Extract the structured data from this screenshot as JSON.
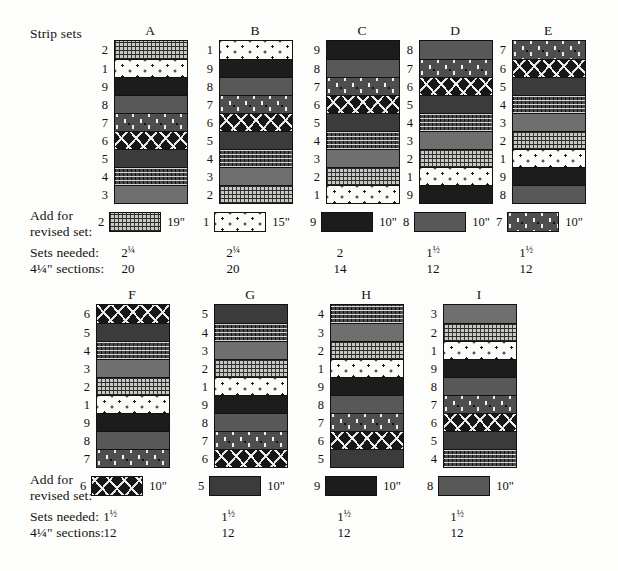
{
  "header": {
    "strip_sets_label": "Strip sets"
  },
  "row_labels": {
    "add_for": "Add for",
    "revised_set": "revised set:",
    "sets_needed": "Sets needed:",
    "sections": "4¼\" sections:"
  },
  "fabric_legend": {
    "1": "white-small-diamond-print",
    "2": "light-grey-pindot-grid",
    "3": "medium-grey-solid",
    "4": "dark-grey-pindot-grid",
    "5": "dark-charcoal-solid",
    "6": "black-white-diagonal-dash-print",
    "7": "dark-grey-light-comma-dot-print",
    "8": "dark-medium-grey-solid",
    "9": "near-black-solid"
  },
  "colors": {
    "fabric_1": "#fbfbf7",
    "fabric_2": "#c9c9c3",
    "fabric_3": "#6f6f6f",
    "fabric_4": "#4a4a4a",
    "fabric_5": "#3b3b3b",
    "fabric_6": "#171717",
    "fabric_7": "#4e4e4e",
    "fabric_8": "#585858",
    "fabric_9": "#1c1c1c",
    "outline": "#111111",
    "page_background": "#fdfdfb"
  },
  "strip_sets": [
    {
      "name": "A",
      "strips": [
        "2",
        "1",
        "9",
        "8",
        "7",
        "6",
        "5",
        "4",
        "3"
      ],
      "add_strip": "2",
      "add_length": "19\"",
      "sets_needed": "2¼",
      "sections": "20"
    },
    {
      "name": "B",
      "strips": [
        "1",
        "9",
        "8",
        "7",
        "6",
        "5",
        "4",
        "3",
        "2"
      ],
      "add_strip": "1",
      "add_length": "15\"",
      "sets_needed": "2¼",
      "sections": "20"
    },
    {
      "name": "C",
      "strips": [
        "9",
        "8",
        "7",
        "6",
        "5",
        "4",
        "3",
        "2",
        "1"
      ],
      "add_strip": "9",
      "add_length": "10\"",
      "sets_needed": "2",
      "sections": "14"
    },
    {
      "name": "D",
      "strips": [
        "8",
        "7",
        "6",
        "5",
        "4",
        "3",
        "2",
        "1",
        "9"
      ],
      "add_strip": "8",
      "add_length": "10\"",
      "sets_needed": "1½",
      "sections": "12"
    },
    {
      "name": "E",
      "strips": [
        "7",
        "6",
        "5",
        "4",
        "3",
        "2",
        "1",
        "9",
        "8"
      ],
      "add_strip": "7",
      "add_length": "10\"",
      "sets_needed": "1½",
      "sections": "12"
    },
    {
      "name": "F",
      "strips": [
        "6",
        "5",
        "4",
        "3",
        "2",
        "1",
        "9",
        "8",
        "7"
      ],
      "add_strip": "6",
      "add_length": "10\"",
      "sets_needed": "1½",
      "sections": "12"
    },
    {
      "name": "G",
      "strips": [
        "5",
        "4",
        "3",
        "2",
        "1",
        "9",
        "8",
        "7",
        "6"
      ],
      "add_strip": "5",
      "add_length": "10\"",
      "sets_needed": "1½",
      "sections": "12"
    },
    {
      "name": "H",
      "strips": [
        "4",
        "3",
        "2",
        "1",
        "9",
        "8",
        "7",
        "6",
        "5"
      ],
      "add_strip": "9",
      "add_length": "10\"",
      "sets_needed": "1½",
      "sections": "12"
    },
    {
      "name": "I",
      "strips": [
        "3",
        "2",
        "1",
        "9",
        "8",
        "7",
        "6",
        "5",
        "4"
      ],
      "add_strip": "8",
      "add_length": "10\"",
      "sets_needed": "1½",
      "sections": "12"
    }
  ]
}
